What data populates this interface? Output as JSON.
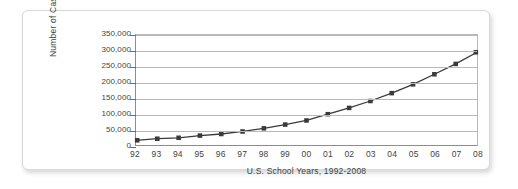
{
  "chart_data": {
    "type": "line",
    "title": "",
    "xlabel": "U.S.  School Years, 1992-2008",
    "ylabel": "Number of Cases",
    "categories": [
      "92",
      "93",
      "94",
      "95",
      "96",
      "97",
      "98",
      "99",
      "00",
      "01",
      "02",
      "03",
      "04",
      "05",
      "06",
      "07",
      "08"
    ],
    "values": [
      15000,
      20000,
      23000,
      30000,
      35000,
      43000,
      53000,
      65000,
      78000,
      98000,
      118000,
      140000,
      165000,
      193000,
      225000,
      258000,
      295000
    ],
    "ylim": [
      0,
      350000
    ],
    "ytick_values": [
      0,
      50000,
      100000,
      150000,
      200000,
      250000,
      300000,
      350000
    ],
    "ytick_labels": [
      "0",
      "50,000",
      "100,000",
      "150,000",
      "200,000",
      "250,000",
      "300,000",
      "350,000"
    ],
    "grid": true,
    "legend": false,
    "series_color": "#3a3a3a",
    "grid_color": "#b9b9b9",
    "axis_color": "#8d8d8d",
    "marker": "square"
  },
  "figure": {
    "background": "#ffffff",
    "card_border_color": "#d9d9d9"
  }
}
